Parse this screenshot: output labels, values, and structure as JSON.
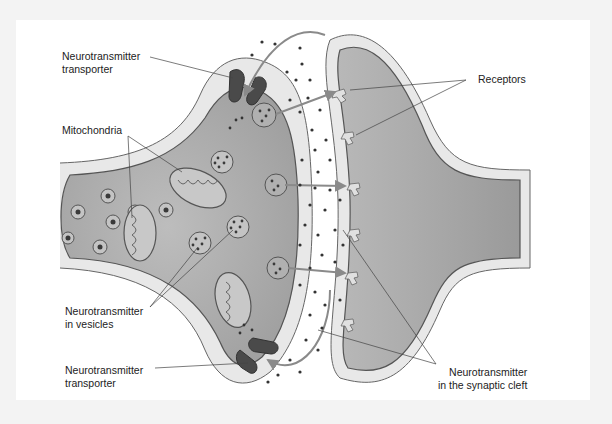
{
  "diagram": {
    "labels": {
      "transporter_top": [
        "Neurotransmitter",
        "transporter"
      ],
      "mitochondria": "Mitochondria",
      "vesicles": [
        "Neurotransmitter",
        "in vesicles"
      ],
      "transporter_bottom": [
        "Neurotransmitter",
        "transporter"
      ],
      "receptors": "Receptors",
      "cleft": [
        "Neurotransmitter",
        "in the synaptic cleft"
      ]
    },
    "colors": {
      "frame": "#f3f3f3",
      "panel": "#ffffff",
      "cytoplasm": "#a9a9a9",
      "membrane_sheath": "#e6e6e6",
      "outline": "#555555",
      "transporter": "#4a4a4a",
      "arrow": "#8a8a8a",
      "dot": "#333333",
      "leader_line": "#444444"
    }
  }
}
